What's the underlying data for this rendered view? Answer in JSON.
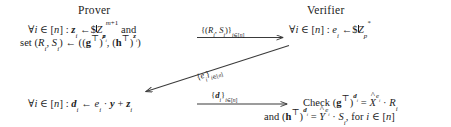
{
  "diagram": {
    "type": "protocol-interaction",
    "parties": {
      "prover": "Prover",
      "verifier": "Verifier"
    },
    "prover_steps": {
      "line1_prefix": "∀",
      "line1": "∀i ∈ [n] : z_i ←$ Z_p^{m+1} and",
      "line2": "set (R_i, S_i) ← ((g^⊤)^{z_i}, (h^⊤)^{z_i})",
      "line3": "∀i ∈ [n] : d_i ← e_i · y + z_i"
    },
    "verifier_steps": {
      "line1": "∀i ∈ [n] : e_i ←$ Z_p^*",
      "line2": "Check (g^⊤)^{d_i} = X̂^{e_i} · R_i",
      "line3": "and (h^⊤)^{d_i} = Ŷ^{e_i} · S_i, for i ∈ [n]"
    },
    "messages": [
      {
        "id": "commitment",
        "label": "{(R_i, S_i)}_{i∈[n]}",
        "direction": "prover-to-verifier",
        "style": "horizontal"
      },
      {
        "id": "challenge",
        "label": "{e_i}_{i∈[n]}",
        "direction": "verifier-to-prover",
        "style": "diagonal"
      },
      {
        "id": "response",
        "label": "{d_i}_{i∈[n]}",
        "direction": "prover-to-verifier",
        "style": "horizontal"
      }
    ],
    "symbols": {
      "n": "n",
      "i": "i",
      "m_plus_1": "m+1",
      "p": "p",
      "star": "*",
      "forall": "∀",
      "in": "∈",
      "gets": "←",
      "dollar": "$",
      "cdot": "·",
      "plus": "+",
      "equals": "=",
      "transpose": "⊤"
    },
    "colors": {
      "ink": "#1b1b1b",
      "background": "#ffffff",
      "arrow": "#3a3a3a"
    }
  }
}
